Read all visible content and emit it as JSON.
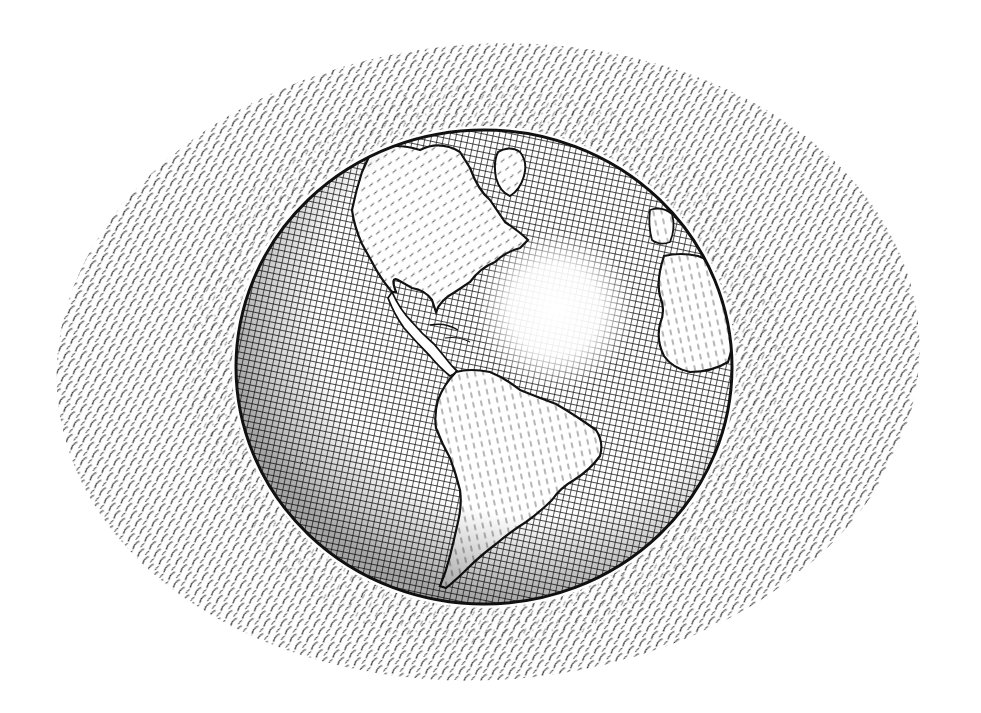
{
  "illustration": {
    "subject": "Pen-and-ink globe showing the Americas",
    "style": "crosshatched engraving",
    "colors": {
      "ink": "#1a1a1a",
      "paper": "#ffffff",
      "halo_ink": "#2a2a2a"
    },
    "halo": {
      "cx": 488,
      "cy": 362,
      "rx": 432,
      "ry": 318
    },
    "globe": {
      "cx": 484,
      "cy": 367,
      "rx": 248,
      "ry": 237
    },
    "highlight": {
      "cx": 555,
      "cy": 310,
      "r": 70
    },
    "landmasses": [
      {
        "name": "North America"
      },
      {
        "name": "Greenland"
      },
      {
        "name": "South America"
      },
      {
        "name": "Africa"
      },
      {
        "name": "Iberia"
      }
    ]
  }
}
